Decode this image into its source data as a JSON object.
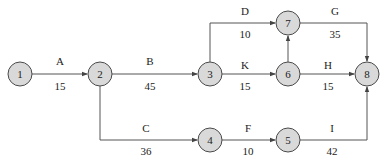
{
  "diagram": {
    "type": "activity-on-arrow network",
    "nodes": [
      {
        "id": "1",
        "label": "1",
        "x": 20,
        "y": 74
      },
      {
        "id": "2",
        "label": "2",
        "x": 100,
        "y": 74
      },
      {
        "id": "3",
        "label": "3",
        "x": 210,
        "y": 74
      },
      {
        "id": "4",
        "label": "4",
        "x": 210,
        "y": 140
      },
      {
        "id": "5",
        "label": "5",
        "x": 288,
        "y": 140
      },
      {
        "id": "6",
        "label": "6",
        "x": 288,
        "y": 74
      },
      {
        "id": "7",
        "label": "7",
        "x": 288,
        "y": 23
      },
      {
        "id": "8",
        "label": "8",
        "x": 367,
        "y": 74
      }
    ],
    "edges": [
      {
        "activity": "A",
        "duration": "15",
        "from": "1",
        "to": "2"
      },
      {
        "activity": "B",
        "duration": "45",
        "from": "2",
        "to": "3"
      },
      {
        "activity": "C",
        "duration": "36",
        "from": "2",
        "to": "4"
      },
      {
        "activity": "D",
        "duration": "10",
        "from": "3",
        "to": "7"
      },
      {
        "activity": "K",
        "duration": "15",
        "from": "3",
        "to": "6"
      },
      {
        "activity": "F",
        "duration": "10",
        "from": "4",
        "to": "5"
      },
      {
        "activity": "G",
        "duration": "35",
        "from": "7",
        "to": "8"
      },
      {
        "activity": "H",
        "duration": "15",
        "from": "6",
        "to": "8"
      },
      {
        "activity": "I",
        "duration": "42",
        "from": "5",
        "to": "8"
      },
      {
        "activity": "",
        "duration": "",
        "from": "6",
        "to": "7"
      }
    ]
  }
}
